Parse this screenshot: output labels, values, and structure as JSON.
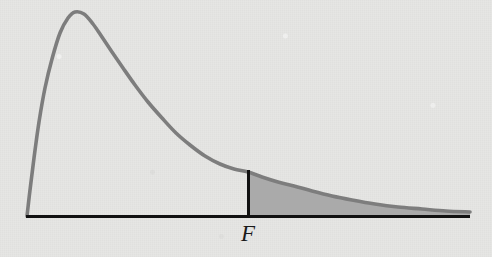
{
  "figure": {
    "kind": "f-distribution-density-with-shaded-right-tail",
    "width": 492,
    "height": 257,
    "background_color": "#e6e6e4",
    "axis_color": "#111111",
    "curve_color": "#7d7d7d",
    "shade_color": "#a6a6a6"
  },
  "labels": {
    "critical_value": "F"
  },
  "chart_data": {
    "type": "line",
    "title": "",
    "xlabel": "",
    "ylabel": "",
    "grid": false,
    "legend": false,
    "axis_ranges": {
      "x_axis_pixels": [
        26,
        470
      ],
      "y_baseline_pixel": 216
    },
    "curve_name": "F-distribution density",
    "curve_points_px": [
      [
        27,
        216
      ],
      [
        30,
        190
      ],
      [
        34,
        158
      ],
      [
        39,
        122
      ],
      [
        45,
        88
      ],
      [
        52,
        59
      ],
      [
        60,
        33
      ],
      [
        68,
        18
      ],
      [
        75,
        12
      ],
      [
        84,
        14
      ],
      [
        93,
        24
      ],
      [
        102,
        37
      ],
      [
        112,
        52
      ],
      [
        123,
        68
      ],
      [
        135,
        85
      ],
      [
        148,
        102
      ],
      [
        162,
        118
      ],
      [
        176,
        133
      ],
      [
        190,
        145
      ],
      [
        205,
        156
      ],
      [
        220,
        164
      ],
      [
        234,
        169
      ],
      [
        248,
        172
      ],
      [
        262,
        177
      ],
      [
        278,
        182
      ],
      [
        294,
        186
      ],
      [
        312,
        191
      ],
      [
        332,
        196
      ],
      [
        352,
        200
      ],
      [
        375,
        204
      ],
      [
        398,
        207
      ],
      [
        422,
        209
      ],
      [
        446,
        211
      ],
      [
        470,
        212
      ]
    ],
    "peak_px": [
      75,
      12
    ],
    "critical_value_px": 248,
    "critical_value_curve_y_px": 172,
    "shaded_tail": {
      "label": "F",
      "from_x_px": 248,
      "to_x_px": 470,
      "description": "right-tail rejection region under the F density curve"
    },
    "annotations": [
      {
        "text": "F",
        "x_px": 250,
        "y_px": 243,
        "style": "italic-serif",
        "role": "critical-value-tick-label"
      }
    ]
  }
}
